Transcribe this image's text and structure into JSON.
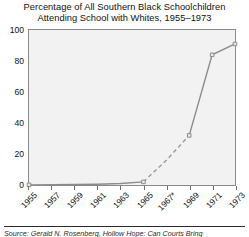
{
  "chart_data": {
    "type": "line",
    "title": "Percentage of All Southern Black Schoolchildren Attending School with Whites, 1955–1973",
    "title_lines": [
      "Percentage of All Southern Black Schoolchildren",
      "Attending School with Whites, 1955–1973"
    ],
    "xlabel": "",
    "ylabel": "",
    "x": [
      "1955",
      "1957",
      "1959",
      "1961",
      "1963",
      "1965",
      "1967*",
      "1969",
      "1971",
      "1973"
    ],
    "categories": [
      "1955",
      "1957",
      "1959",
      "1961",
      "1963",
      "1965",
      "1967*",
      "1969",
      "1971",
      "1973"
    ],
    "values": [
      0.1,
      0.2,
      0.3,
      0.5,
      1.0,
      2.0,
      16.0,
      32.0,
      84.0,
      91.0
    ],
    "series": [
      {
        "name": "Percentage attending school with whites",
        "values": [
          0.1,
          0.2,
          0.3,
          0.5,
          1.0,
          2.0,
          16.0,
          32.0,
          84.0,
          91.0
        ]
      }
    ],
    "segment_styles": [
      "solid",
      "solid",
      "solid",
      "solid",
      "solid",
      "dashed",
      "dashed",
      "solid",
      "solid"
    ],
    "markers": [
      "1955",
      "1965",
      "1969",
      "1971",
      "1973"
    ],
    "xlim": [
      0,
      9
    ],
    "ylim": [
      0,
      100
    ],
    "yticks": [
      0,
      20,
      40,
      60,
      80,
      100
    ],
    "ytick_labels": [
      "0",
      "20",
      "40",
      "60",
      "80",
      "100"
    ],
    "xtick_labels": [
      "1955",
      "1957",
      "1959",
      "1961",
      "1963",
      "1965",
      "1967*",
      "1969",
      "1971",
      "1973"
    ],
    "grid": false,
    "legend": "none",
    "line_color": "#8c8c8c",
    "plot_bg": "#f2f2f2",
    "frame_color": "#8a8a8a",
    "footnote_marker": "*"
  },
  "source": {
    "text": "Source: Gerald N. Rosenberg, Hollow Hope: Can Courts Bring"
  }
}
